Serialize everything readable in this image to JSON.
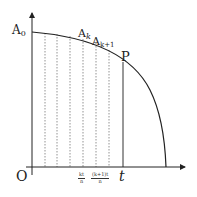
{
  "diagram": {
    "type": "area-under-curve-partition",
    "colors": {
      "axis": "#222222",
      "curve": "#222222",
      "dashed": "#777777",
      "background": "#ffffff"
    },
    "labels": {
      "origin": "O",
      "a0": "A",
      "a0_sub": "0",
      "ak": "A",
      "ak_sub": "k",
      "ak1": "A",
      "ak1_sub": "k+1",
      "p": "P",
      "t": "t",
      "kt_num": "kt",
      "kt_den": "n",
      "k1t_num": "(k+1)t",
      "k1t_den": "n"
    },
    "dashed_x": [
      45,
      57,
      70,
      83,
      96,
      109
    ],
    "solid_x": 123
  }
}
